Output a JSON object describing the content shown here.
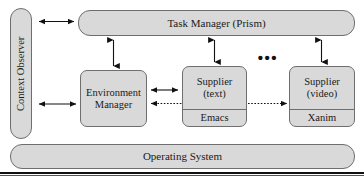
{
  "figure": {
    "kind": "system-architecture-block-diagram",
    "background_color": "#ffffff",
    "box_fill_color": "#d9d9d9",
    "box_border_color": "#6e6e6e",
    "text_color": "#1a1a1a",
    "arrow_color": "#111111"
  },
  "blocks": {
    "context_observer": {
      "label": "Context Observer",
      "orientation": "vertical"
    },
    "task_manager": {
      "label": "Task Manager (Prism)"
    },
    "environment_manager": {
      "line1": "Environment",
      "line2": "Manager"
    },
    "supplier_text": {
      "line1": "Supplier",
      "line2": "(text)",
      "implementation": "Emacs"
    },
    "supplier_video": {
      "line1": "Supplier",
      "line2": "(video)",
      "implementation": "Xanim"
    },
    "operating_system": {
      "label": "Operating System"
    },
    "ellipsis": {
      "label": "•••"
    }
  },
  "connectors": [
    {
      "name": "context-observer-to-task-manager",
      "style": "solid",
      "heads": "both",
      "direction": "horizontal"
    },
    {
      "name": "context-observer-to-environment-manager",
      "style": "solid",
      "heads": "both",
      "direction": "horizontal"
    },
    {
      "name": "task-manager-to-environment-manager",
      "style": "solid",
      "heads": "both",
      "direction": "vertical"
    },
    {
      "name": "task-manager-to-supplier-text",
      "style": "solid",
      "heads": "both",
      "direction": "vertical"
    },
    {
      "name": "task-manager-to-supplier-video",
      "style": "solid",
      "heads": "both",
      "direction": "vertical"
    },
    {
      "name": "environment-manager-to-supplier-text",
      "style": "solid",
      "heads": "both",
      "direction": "horizontal"
    },
    {
      "name": "supplier-text-to-environment-manager-dotted",
      "style": "dotted",
      "heads": "left",
      "direction": "horizontal"
    },
    {
      "name": "supplier-text-to-supplier-video-dotted",
      "style": "dotted",
      "heads": "right",
      "direction": "horizontal"
    }
  ]
}
